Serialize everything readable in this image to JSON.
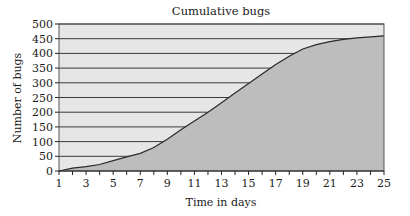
{
  "chart_data": {
    "type": "area",
    "title": "Cumulative bugs",
    "xlabel": "Time in days",
    "ylabel": "Number of bugs",
    "xlim": [
      1,
      25
    ],
    "ylim": [
      0,
      500
    ],
    "x": [
      1,
      2,
      3,
      4,
      5,
      6,
      7,
      8,
      9,
      10,
      11,
      12,
      13,
      14,
      15,
      16,
      17,
      18,
      19,
      20,
      21,
      22,
      23,
      24,
      25
    ],
    "series": [
      {
        "name": "Cumulative bugs",
        "values": [
          0,
          10,
          15,
          22,
          35,
          48,
          60,
          80,
          108,
          140,
          170,
          200,
          232,
          265,
          298,
          330,
          362,
          390,
          415,
          430,
          440,
          448,
          453,
          456,
          460
        ]
      }
    ],
    "x_tick_labels": [
      "1",
      "3",
      "5",
      "7",
      "9",
      "11",
      "13",
      "15",
      "17",
      "19",
      "21",
      "23",
      "25"
    ],
    "x_tick_values": [
      1,
      3,
      5,
      7,
      9,
      11,
      13,
      15,
      17,
      19,
      21,
      23,
      25
    ],
    "y_tick_labels": [
      "0",
      "50",
      "100",
      "150",
      "200",
      "250",
      "300",
      "350",
      "400",
      "450",
      "500"
    ],
    "y_tick_values": [
      0,
      50,
      100,
      150,
      200,
      250,
      300,
      350,
      400,
      450,
      500
    ],
    "grid": "horizontal",
    "legend": "none",
    "colors": {
      "plot_background": "#e6e6e6",
      "area_fill": "#bdbdbd",
      "line": "#2a2a2a",
      "grid": "#3a3a3a"
    }
  }
}
